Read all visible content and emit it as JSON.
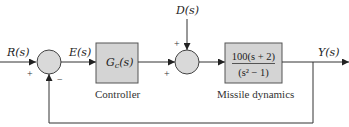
{
  "diagram": {
    "type": "feedback-block-diagram",
    "signals": {
      "input": "R(s)",
      "error": "E(s)",
      "disturbance": "D(s)",
      "output": "Y(s)"
    },
    "blocks": [
      {
        "id": "controller",
        "content": "Gc(s)",
        "caption": "Controller"
      },
      {
        "id": "plant",
        "numerator": "100(s + 2)",
        "denominator": "(s² − 1)",
        "caption": "Missile dynamics"
      }
    ],
    "summing_junctions": [
      {
        "id": "sum1",
        "signs": {
          "left": "+",
          "bottom": "−"
        }
      },
      {
        "id": "sum2",
        "signs": {
          "top": "+",
          "left": "+"
        }
      }
    ],
    "colors": {
      "block_fill": "#d4d4d4",
      "junction_fill": "#d9d9d9",
      "line": "#333333"
    }
  }
}
